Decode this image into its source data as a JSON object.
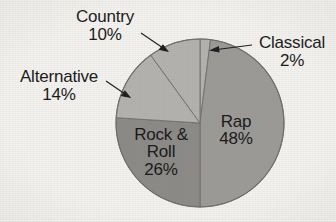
{
  "chart_data": {
    "type": "pie",
    "title": "",
    "subtitle": "",
    "xlabel": "",
    "ylabel": "",
    "legend_position": "none",
    "grid": false,
    "units": "percent",
    "start_angle_deg": 0,
    "direction": "clockwise",
    "categories": [
      "Classical",
      "Rap",
      "Rock & Roll",
      "Alternative",
      "Country"
    ],
    "values": [
      2,
      48,
      26,
      14,
      10
    ],
    "slices": [
      {
        "label": "Classical",
        "value": 2,
        "value_text": "2%",
        "color": "#b3b2ae",
        "label_placement": "outside",
        "has_leader_arrow": true
      },
      {
        "label": "Rap",
        "value": 48,
        "value_text": "48%",
        "color": "#9b9a96",
        "label_placement": "inside",
        "has_leader_arrow": false
      },
      {
        "label": "Rock & Roll",
        "label_line1": "Rock &",
        "label_line2": "Roll",
        "value": 26,
        "value_text": "26%",
        "color": "#8b8a86",
        "label_placement": "inside",
        "has_leader_arrow": false
      },
      {
        "label": "Alternative",
        "value": 14,
        "value_text": "14%",
        "color": "#b3b2ae",
        "label_placement": "outside",
        "has_leader_arrow": true
      },
      {
        "label": "Country",
        "value": 10,
        "value_text": "10%",
        "color": "#b3b2ae",
        "label_placement": "outside",
        "has_leader_arrow": true
      }
    ]
  },
  "canvas": {
    "background_color": "#f4f2ef",
    "text_color": "#18181a",
    "outline_color": "#6f6e6a"
  },
  "labels": {
    "country": {
      "name": "Country",
      "pct": "10%"
    },
    "classical": {
      "name": "Classical",
      "pct": "2%"
    },
    "alternative": {
      "name": "Alternative",
      "pct": "14%"
    },
    "rap": {
      "name": "Rap",
      "pct": "48%"
    },
    "rockroll": {
      "name_line1": "Rock &",
      "name_line2": "Roll",
      "pct": "26%"
    }
  }
}
